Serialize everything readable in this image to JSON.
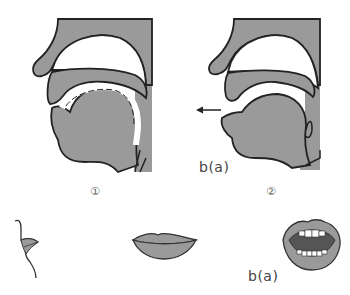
{
  "diagram": {
    "colors": {
      "fill": "#9a9a9a",
      "outline": "#222222",
      "background": "#ffffff",
      "mouth_interior": "#555555",
      "teeth": "#ffffff"
    },
    "panels": [
      {
        "id": "panel-1",
        "number_label": "①",
        "description": "sagittal vocal tract, lips closed, airflow held in mouth"
      },
      {
        "id": "panel-2",
        "number_label": "②",
        "description": "sagittal vocal tract, lips released, air expelled",
        "sound_label": "b(a)",
        "arrow": "airflow-out"
      }
    ],
    "bottom_row": [
      {
        "id": "lips-profile",
        "description": "side view of closed lips"
      },
      {
        "id": "lips-front-closed",
        "description": "front view of closed lips"
      },
      {
        "id": "lips-front-open",
        "description": "front view of open mouth showing teeth",
        "sound_label": "b(a)"
      }
    ]
  }
}
